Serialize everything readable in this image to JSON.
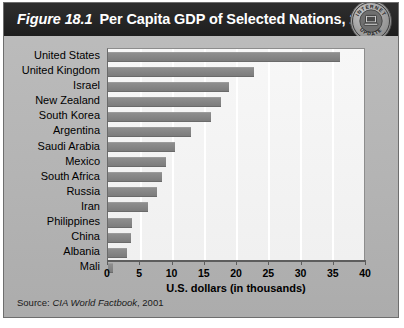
{
  "figure": {
    "number": "Figure 18.1",
    "title": "Per Capita GDP of Selected Nations, 2000",
    "source_prefix": "Source:",
    "source_title": "CIA World Factbook",
    "source_year": ", 2001"
  },
  "badge": {
    "top_text": "INTERNET",
    "bottom_text": "UPDATE",
    "icon": "computer-icon"
  },
  "colors": {
    "titlebar": "#262626",
    "panel": "#b7b7b7",
    "bar": "#828282",
    "plot_bg": "#f4f4f4",
    "gridline": "#ffffff",
    "axis": "#5d5d5d"
  },
  "chart_data": {
    "type": "bar",
    "orientation": "horizontal",
    "title": "Per Capita GDP of Selected Nations, 2000",
    "xlabel": "U.S. dollars (in thousands)",
    "ylabel": "",
    "xlim": [
      0,
      40
    ],
    "xticks": [
      0,
      5,
      10,
      15,
      20,
      25,
      30,
      35,
      40
    ],
    "grid": true,
    "legend": false,
    "categories": [
      "United States",
      "United Kingdom",
      "Israel",
      "New Zealand",
      "South Korea",
      "Argentina",
      "Saudi Arabia",
      "Mexico",
      "South Africa",
      "Russia",
      "Iran",
      "Philippines",
      "China",
      "Albania",
      "Mali"
    ],
    "values": [
      36.2,
      22.8,
      18.9,
      17.7,
      16.1,
      12.9,
      10.5,
      9.1,
      8.5,
      7.7,
      6.3,
      3.8,
      3.6,
      3.0,
      0.8
    ]
  }
}
